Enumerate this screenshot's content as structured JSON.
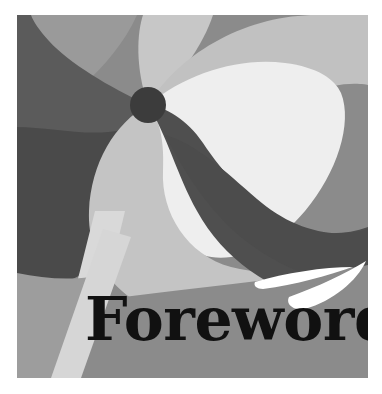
{
  "page": {
    "kind": "book-cover-artwork",
    "width": 382,
    "height": 394,
    "background": "#ffffff"
  },
  "artwork": {
    "title": "Foreword",
    "caption_text": "Foreword",
    "frame": {
      "x": 17,
      "y": 15,
      "width": 351,
      "height": 363
    },
    "description": "Abstract grayscale pinwheel composition with curved blades, a dark round hub and two white crescent swooshes",
    "palette": {
      "background_mid_gray": "#8b8b8b",
      "light_gray": "#b4b4b4",
      "pale_gray": "#cfcfcf",
      "very_light_gray": "#e3e3e3",
      "near_white": "#f1f1f1",
      "dark_gray": "#4f4f4f",
      "darker_gray": "#454545",
      "hub_dark": "#3c3c3c",
      "text_black": "#111111",
      "swoosh_white": "#ffffff",
      "paper_white": "#ffffff"
    },
    "hub": {
      "cx": 131,
      "cy": 90,
      "r": 18,
      "color": "#3c3c3c"
    },
    "blades": [
      {
        "name": "blade-top-left-dark",
        "tone": "dark_gray"
      },
      {
        "name": "blade-left-light",
        "tone": "light_gray"
      },
      {
        "name": "blade-top-center-pale",
        "tone": "pale_gray"
      },
      {
        "name": "blade-right-near-white",
        "tone": "near_white"
      },
      {
        "name": "blade-lower-center-dark",
        "tone": "darker_gray"
      },
      {
        "name": "blade-lower-left-pale",
        "tone": "pale_gray"
      },
      {
        "name": "stripe-bottom-left-light",
        "tone": "very_light_gray"
      }
    ],
    "swooshes": [
      {
        "name": "swoosh-upper",
        "color": "#ffffff"
      },
      {
        "name": "swoosh-lower",
        "color": "#ffffff"
      }
    ]
  },
  "typography": {
    "title_color": "#111111",
    "title_size_px": 58,
    "title_x": 85,
    "title_y": 335
  }
}
